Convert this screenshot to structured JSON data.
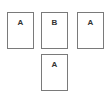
{
  "diagram": {
    "cards": [
      {
        "label": "A",
        "row": 1,
        "position": "left"
      },
      {
        "label": "B",
        "row": 1,
        "position": "center"
      },
      {
        "label": "A",
        "row": 1,
        "position": "right"
      },
      {
        "label": "A",
        "row": 2,
        "position": "center"
      }
    ]
  },
  "colors": {
    "border": "#7a7a7a",
    "text": "#333333",
    "background": "#ffffff"
  }
}
